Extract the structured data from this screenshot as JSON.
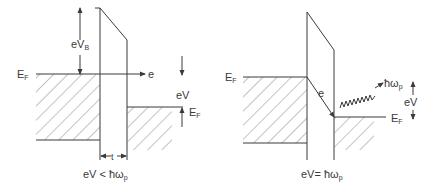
{
  "figure": {
    "left_panel": {
      "fermi_left_label": "E",
      "fermi_left_sub": "F",
      "barrier_height_label": "eV",
      "barrier_height_sub": "B",
      "electron_label": "e",
      "bias_label": "eV",
      "fermi_right_label": "E",
      "fermi_right_sub": "F",
      "thickness_label": "t",
      "condition_label": "eV < ħω",
      "condition_sub": "p"
    },
    "right_panel": {
      "fermi_left_label": "E",
      "fermi_left_sub": "F",
      "electron_label": "e",
      "photon_label": "ħω",
      "photon_sub": "p",
      "bias_label": "eV",
      "fermi_right_label": "E",
      "fermi_right_sub": "F",
      "condition_label": "eV= ħω",
      "condition_sub": "p"
    }
  },
  "colors": {
    "line": "#3a3a3a",
    "hatch": "#6a6a6a",
    "background": "#ffffff"
  }
}
